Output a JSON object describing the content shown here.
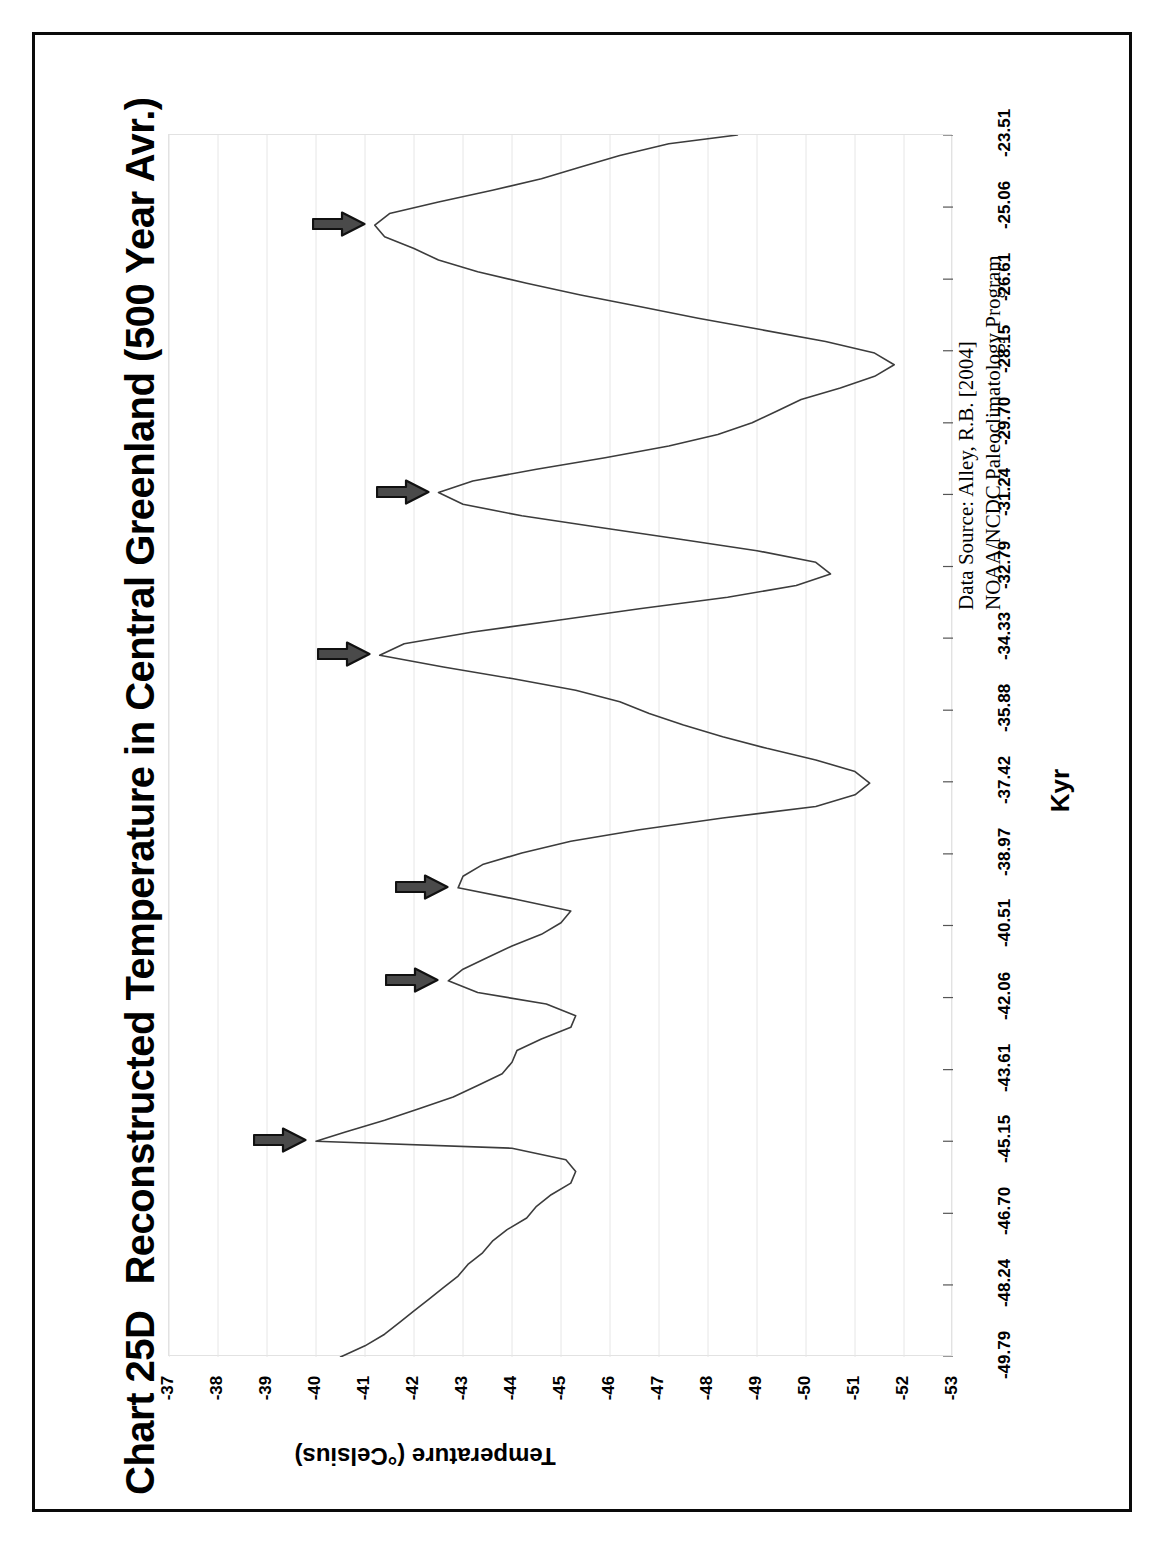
{
  "page": {
    "background": "#ffffff",
    "frame_color": "#0a0a0a"
  },
  "header": {
    "chart_id": "Chart 25D",
    "title": "Reconstructed Temperature in Central Greenland (500 Year Avr.)"
  },
  "source": {
    "line1": "Data Source: Alley, R.B. [2004]",
    "line2": "NOAA/NCDC Paleoclimatology Program"
  },
  "chart_data": {
    "type": "line",
    "orientation": "rotated-90-ccw",
    "title": "Reconstructed Temperature in Central Greenland (500 Year Avr.)",
    "xlabel": "Kyr",
    "ylabel": "Temperature (°Celsius)",
    "grid": true,
    "legend": "none",
    "series_name": "GISP2 reconstructed temperature",
    "line_color": "#3c3c3c",
    "xlim": [
      -49.79,
      -23.51
    ],
    "ylim": [
      -53,
      -37
    ],
    "xticks": [
      "-49.79",
      "-48.24",
      "-46.70",
      "-45.15",
      "-43.61",
      "-42.06",
      "-40.51",
      "-38.97",
      "-37.42",
      "-35.88",
      "-34.33",
      "-32.79",
      "-31.24",
      "-29.70",
      "-28.15",
      "-26.61",
      "-25.06",
      "-23.51"
    ],
    "xtick_values": [
      -49.79,
      -48.24,
      -46.7,
      -45.15,
      -43.61,
      -42.06,
      -40.51,
      -38.97,
      -37.42,
      -35.88,
      -34.33,
      -32.79,
      -31.24,
      -29.7,
      -28.15,
      -26.61,
      -25.06,
      -23.51
    ],
    "yticks": [
      "-37",
      "-38",
      "-39",
      "-40",
      "-41",
      "-42",
      "-43",
      "-44",
      "-45",
      "-46",
      "-47",
      "-48",
      "-49",
      "-50",
      "-51",
      "-52",
      "-53"
    ],
    "ytick_values": [
      -37,
      -38,
      -39,
      -40,
      -41,
      -42,
      -43,
      -44,
      -45,
      -46,
      -47,
      -48,
      -49,
      -50,
      -51,
      -52,
      -53
    ],
    "x": [
      -49.79,
      -49.55,
      -49.3,
      -49.05,
      -48.8,
      -48.55,
      -48.3,
      -48.05,
      -47.8,
      -47.55,
      -47.3,
      -47.05,
      -46.8,
      -46.55,
      -46.3,
      -46.05,
      -45.8,
      -45.55,
      -45.3,
      -45.15,
      -44.95,
      -44.7,
      -44.45,
      -44.2,
      -43.95,
      -43.7,
      -43.45,
      -43.2,
      -42.95,
      -42.7,
      -42.45,
      -42.2,
      -41.95,
      -41.7,
      -41.45,
      -41.2,
      -40.95,
      -40.7,
      -40.45,
      -40.2,
      -39.95,
      -39.7,
      -39.45,
      -39.2,
      -38.95,
      -38.7,
      -38.45,
      -38.2,
      -37.95,
      -37.7,
      -37.45,
      -37.2,
      -36.95,
      -36.7,
      -36.45,
      -36.2,
      -35.95,
      -35.7,
      -35.45,
      -35.2,
      -34.95,
      -34.7,
      -34.45,
      -34.2,
      -33.95,
      -33.7,
      -33.45,
      -33.2,
      -32.95,
      -32.7,
      -32.45,
      -32.2,
      -31.95,
      -31.7,
      -31.45,
      -31.2,
      -30.95,
      -30.7,
      -30.45,
      -30.2,
      -29.95,
      -29.7,
      -29.45,
      -29.2,
      -28.95,
      -28.7,
      -28.45,
      -28.2,
      -27.95,
      -27.7,
      -27.45,
      -27.2,
      -26.95,
      -26.7,
      -26.45,
      -26.2,
      -25.95,
      -25.7,
      -25.45,
      -25.2,
      -24.95,
      -24.7,
      -24.45,
      -24.2,
      -23.95,
      -23.7,
      -23.51
    ],
    "y": [
      -40.5,
      -41.0,
      -41.4,
      -41.7,
      -42.0,
      -42.3,
      -42.6,
      -42.9,
      -43.1,
      -43.4,
      -43.6,
      -43.9,
      -44.3,
      -44.5,
      -44.8,
      -45.2,
      -45.3,
      -45.1,
      -44.0,
      -40.0,
      -40.6,
      -41.4,
      -42.1,
      -42.8,
      -43.3,
      -43.8,
      -44.0,
      -44.1,
      -44.6,
      -45.2,
      -45.3,
      -44.7,
      -43.3,
      -42.7,
      -43.0,
      -43.5,
      -44.0,
      -44.6,
      -45.0,
      -45.2,
      -44.1,
      -42.9,
      -43.0,
      -43.4,
      -44.2,
      -45.2,
      -46.6,
      -48.3,
      -50.2,
      -51.0,
      -51.3,
      -51.0,
      -50.2,
      -49.2,
      -48.3,
      -47.5,
      -46.8,
      -46.2,
      -45.3,
      -44.0,
      -42.6,
      -41.3,
      -41.8,
      -43.2,
      -44.9,
      -46.6,
      -48.4,
      -49.8,
      -50.5,
      -50.2,
      -49.0,
      -47.4,
      -45.8,
      -44.2,
      -43.0,
      -42.5,
      -43.2,
      -44.5,
      -45.9,
      -47.2,
      -48.2,
      -48.9,
      -49.4,
      -49.9,
      -50.7,
      -51.4,
      -51.8,
      -51.4,
      -50.4,
      -49.1,
      -47.8,
      -46.6,
      -45.4,
      -44.3,
      -43.3,
      -42.5,
      -42.0,
      -41.4,
      -41.2,
      -41.5,
      -42.5,
      -43.6,
      -44.6,
      -45.4,
      -46.2,
      -47.2,
      -48.6,
      -49.6,
      -50.4,
      -51.0,
      -51.5,
      -51.9,
      -52.0,
      -51.5,
      -50.6,
      -49.6,
      -48.6,
      -47.5,
      -46.4,
      -45.2,
      -44.0,
      -43.0,
      -42.2,
      -41.8,
      -41.5,
      -41.3,
      -41.2,
      -41.1,
      -41.3,
      -41.7,
      -42.6,
      -43.8,
      -44.9,
      -45.7,
      -46.1,
      -46.0,
      -45.4,
      -44.6,
      -44.0,
      -43.6,
      -43.4,
      -43.6,
      -44.3,
      -45.5,
      -46.8,
      -48.0,
      -49.0,
      -49.8,
      -50.6,
      -51.3,
      -51.8,
      -52.1,
      -52.3,
      -51.8,
      -50.8,
      -49.8,
      -49.2,
      -49.0,
      -49.2,
      -49.5,
      -49.6,
      -49.3,
      -48.9
    ]
  },
  "annotations": {
    "label": "interstadial-marker",
    "symbol": "right-arrow",
    "fill": "#4a4a4a",
    "outline": "#111111",
    "count": 17,
    "markers": [
      {
        "id": "a1",
        "note": "warm peak near -49.8 Kyr"
      },
      {
        "id": "a2",
        "note": "warm peak near -48.5 Kyr"
      },
      {
        "id": "a3",
        "note": "warm peak near -46.9 Kyr"
      },
      {
        "id": "a4",
        "note": "warm peak near -45.2 Kyr"
      },
      {
        "id": "a5",
        "note": "warm peak near -43.4 Kyr"
      },
      {
        "id": "a6",
        "note": "warm peak near -42.1 Kyr"
      },
      {
        "id": "a7",
        "note": "warm peak near -40.5 Kyr"
      },
      {
        "id": "a8",
        "note": "warm peak near -38.2 Kyr"
      },
      {
        "id": "a9",
        "note": "warm peak near -37.4 Kyr"
      },
      {
        "id": "a10",
        "note": "warm peak near -35.5 Kyr"
      },
      {
        "id": "a11",
        "note": "warm peak near -33.8 Kyr"
      },
      {
        "id": "a12",
        "note": "warm peak near -32.2 Kyr"
      },
      {
        "id": "a13",
        "note": "warm peak near -31.1 Kyr"
      },
      {
        "id": "a14",
        "note": "warm peak near -29.3 Kyr"
      },
      {
        "id": "a15",
        "note": "warm peak near -28.3 Kyr"
      },
      {
        "id": "a16",
        "note": "warm peak near -26.7 Kyr"
      },
      {
        "id": "a17",
        "note": "warm peak near -25.2 Kyr"
      }
    ]
  }
}
